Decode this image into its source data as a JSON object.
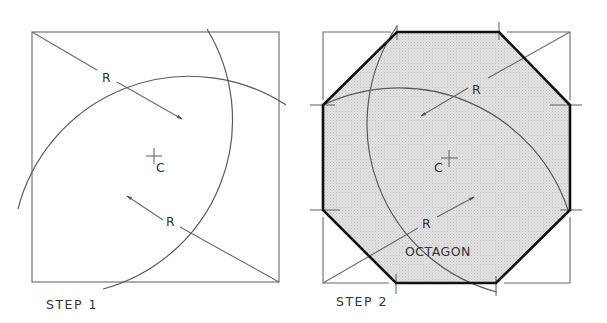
{
  "figure": {
    "step1": {
      "caption": "STEP 1",
      "center_label": "C",
      "radius_label_top": "R",
      "radius_label_bottom": "R"
    },
    "step2": {
      "caption": "STEP 2",
      "center_label": "C",
      "radius_label_top": "R",
      "radius_label_bottom": "R",
      "shape_label": "OCTAGON"
    },
    "colors": {
      "line": "#6a6a6a",
      "outline": "#111111",
      "fill": "#d9d9d9"
    }
  }
}
